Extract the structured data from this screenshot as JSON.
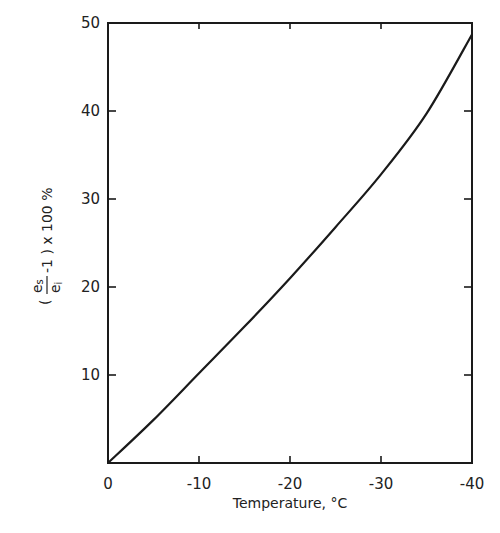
{
  "chart_data": {
    "type": "line",
    "title": "",
    "xlabel": "Temperature,  °C",
    "ylabel": "( e_s / e_i − 1 ) x 100 %",
    "ylabel_parts": {
      "open": "(",
      "num": "e",
      "num_sub": "s",
      "den": "e",
      "den_sub": "i",
      "rest": "-1 ) x 100 %"
    },
    "xlim": [
      0,
      -40
    ],
    "ylim": [
      0,
      50
    ],
    "x_ticks": [
      0,
      -10,
      -20,
      -30,
      -40
    ],
    "x_tick_labels": [
      "0",
      "-10",
      "-20",
      "-30",
      "-40"
    ],
    "y_ticks": [
      10,
      20,
      30,
      40,
      50
    ],
    "y_tick_labels": [
      "10",
      "20",
      "30",
      "40",
      "50"
    ],
    "grid": false,
    "legend": null,
    "series": [
      {
        "name": "ice supersaturation",
        "x": [
          0,
          -5,
          -10,
          -15,
          -20,
          -25,
          -30,
          -35,
          -40
        ],
        "values": [
          0,
          4.9,
          10.2,
          15.5,
          21.0,
          26.8,
          32.8,
          39.7,
          48.7
        ]
      }
    ]
  }
}
